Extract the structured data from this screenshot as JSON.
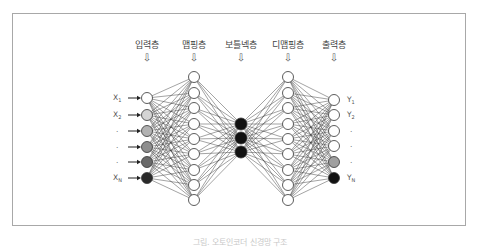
{
  "figure": {
    "caption": "그림. 오토인코더 신경망 구조"
  },
  "layers": [
    {
      "id": "input",
      "label": "입력층",
      "arrow": "⇩",
      "x": 147,
      "nodes": [
        {
          "y": 98,
          "fill": "#ffffff"
        },
        {
          "y": 115,
          "fill": "#d4d4d4"
        },
        {
          "y": 131,
          "fill": "#b2b2b2"
        },
        {
          "y": 147,
          "fill": "#8e8e8e"
        },
        {
          "y": 162,
          "fill": "#6a6a6a"
        },
        {
          "y": 178,
          "fill": "#2a2a2a"
        }
      ]
    },
    {
      "id": "mapping",
      "label": "맵핑층",
      "arrow": "⇩",
      "x": 194,
      "nodes": [
        {
          "y": 77,
          "fill": "#ffffff"
        },
        {
          "y": 93,
          "fill": "#ffffff"
        },
        {
          "y": 108,
          "fill": "#ffffff"
        },
        {
          "y": 124,
          "fill": "#ffffff"
        },
        {
          "y": 139,
          "fill": "#ffffff"
        },
        {
          "y": 154,
          "fill": "#ffffff"
        },
        {
          "y": 170,
          "fill": "#ffffff"
        },
        {
          "y": 185,
          "fill": "#ffffff"
        },
        {
          "y": 200,
          "fill": "#ffffff"
        }
      ]
    },
    {
      "id": "bottleneck",
      "label": "보틀넥층",
      "arrow": "⇩",
      "x": 241,
      "nodes": [
        {
          "y": 124,
          "fill": "#111111"
        },
        {
          "y": 138,
          "fill": "#111111"
        },
        {
          "y": 152,
          "fill": "#111111"
        }
      ]
    },
    {
      "id": "demapping",
      "label": "디맵핑층",
      "arrow": "⇩",
      "x": 288,
      "nodes": [
        {
          "y": 77,
          "fill": "#ffffff"
        },
        {
          "y": 93,
          "fill": "#ffffff"
        },
        {
          "y": 108,
          "fill": "#ffffff"
        },
        {
          "y": 124,
          "fill": "#ffffff"
        },
        {
          "y": 139,
          "fill": "#ffffff"
        },
        {
          "y": 154,
          "fill": "#ffffff"
        },
        {
          "y": 170,
          "fill": "#ffffff"
        },
        {
          "y": 185,
          "fill": "#ffffff"
        },
        {
          "y": 200,
          "fill": "#ffffff"
        }
      ]
    },
    {
      "id": "output",
      "label": "출력층",
      "arrow": "⇩",
      "x": 334,
      "nodes": [
        {
          "y": 100,
          "fill": "#ffffff"
        },
        {
          "y": 115,
          "fill": "#ffffff"
        },
        {
          "y": 131,
          "fill": "#ffffff"
        },
        {
          "y": 146,
          "fill": "#ffffff"
        },
        {
          "y": 162,
          "fill": "#a0a0a0"
        },
        {
          "y": 178,
          "fill": "#111111"
        }
      ]
    }
  ],
  "inputs": [
    {
      "text": "X",
      "sub": "1",
      "y": 98
    },
    {
      "text": "X",
      "sub": "2",
      "y": 115
    },
    {
      "text": "·",
      "sub": "",
      "y": 131
    },
    {
      "text": "·",
      "sub": "",
      "y": 147
    },
    {
      "text": "·",
      "sub": "",
      "y": 162
    },
    {
      "text": "X",
      "sub": "N",
      "y": 178
    }
  ],
  "outputs": [
    {
      "text": "Y",
      "sub": "1",
      "y": 100
    },
    {
      "text": "Y",
      "sub": "2",
      "y": 115
    },
    {
      "text": "·",
      "sub": "",
      "y": 131
    },
    {
      "text": "·",
      "sub": "",
      "y": 146
    },
    {
      "text": "·",
      "sub": "",
      "y": 162
    },
    {
      "text": "Y",
      "sub": "N",
      "y": 178
    }
  ],
  "style": {
    "node_radius": 5.5,
    "bottleneck_radius": 6,
    "edge_color": "#3a3a3a",
    "node_stroke": "#333333",
    "frame_color": "#a8a8a8"
  }
}
